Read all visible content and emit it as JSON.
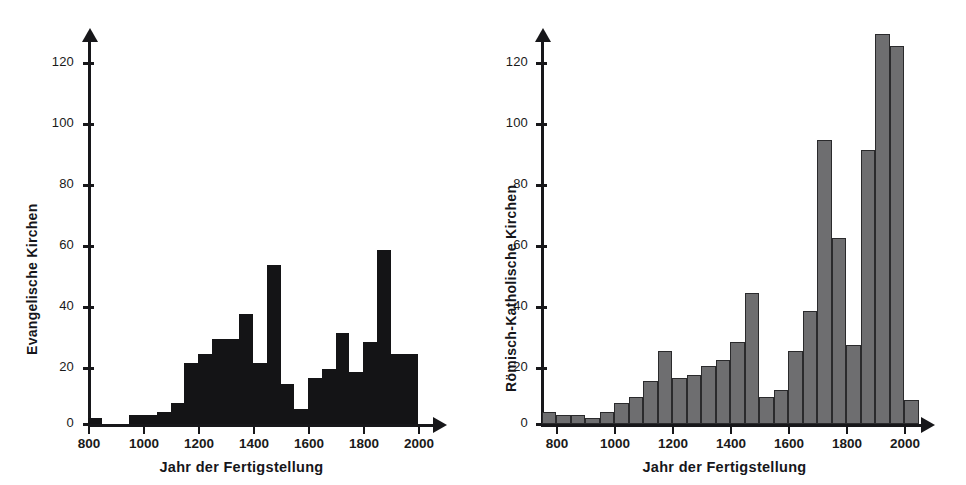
{
  "figure": {
    "background": "#ffffff",
    "panel_count": 2
  },
  "chart_data": [
    {
      "type": "bar",
      "id": "evangelische",
      "title": "",
      "xlabel": "Jahr der Fertigstellung",
      "ylabel": "Evangelische Kirchen",
      "xlim": [
        800,
        2050
      ],
      "ylim": [
        0,
        132
      ],
      "xticks": [
        800,
        1000,
        1200,
        1400,
        1600,
        1800,
        2000
      ],
      "yticks": [
        0,
        20,
        40,
        60,
        80,
        100,
        120
      ],
      "grid": false,
      "legend": null,
      "bin_width": 50,
      "bar_color": "#141416",
      "bin_starts": [
        800,
        850,
        900,
        950,
        1000,
        1050,
        1100,
        1150,
        1200,
        1250,
        1300,
        1350,
        1400,
        1450,
        1500,
        1550,
        1600,
        1650,
        1700,
        1750,
        1800,
        1850,
        1900,
        1950
      ],
      "values": [
        2,
        0,
        0,
        3,
        3,
        4,
        7,
        20,
        23,
        28,
        28,
        36,
        20,
        52,
        13,
        5,
        15,
        18,
        30,
        17,
        27,
        57,
        23,
        23
      ]
    },
    {
      "type": "bar",
      "id": "roemisch-katholische",
      "title": "",
      "xlabel": "Jahr der Fertigstellung",
      "ylabel": "Römisch-Katholische Kirchen",
      "xlim": [
        750,
        2050
      ],
      "ylim": [
        0,
        132
      ],
      "xticks": [
        800,
        1000,
        1200,
        1400,
        1600,
        1800,
        2000
      ],
      "yticks": [
        0,
        20,
        40,
        60,
        80,
        100,
        120
      ],
      "grid": false,
      "legend": null,
      "bin_width": 50,
      "bar_color": "#6e6e70",
      "bar_edge_color": "#2a2a2c",
      "bin_starts": [
        750,
        800,
        850,
        900,
        950,
        1000,
        1050,
        1100,
        1150,
        1200,
        1250,
        1300,
        1350,
        1400,
        1450,
        1500,
        1550,
        1600,
        1650,
        1700,
        1750,
        1800,
        1850,
        1900,
        1950,
        2000
      ],
      "values": [
        4,
        3,
        3,
        2,
        4,
        7,
        9,
        14,
        24,
        15,
        16,
        19,
        21,
        27,
        43,
        9,
        11,
        24,
        37,
        93,
        61,
        26,
        90,
        128,
        124,
        8
      ]
    }
  ]
}
